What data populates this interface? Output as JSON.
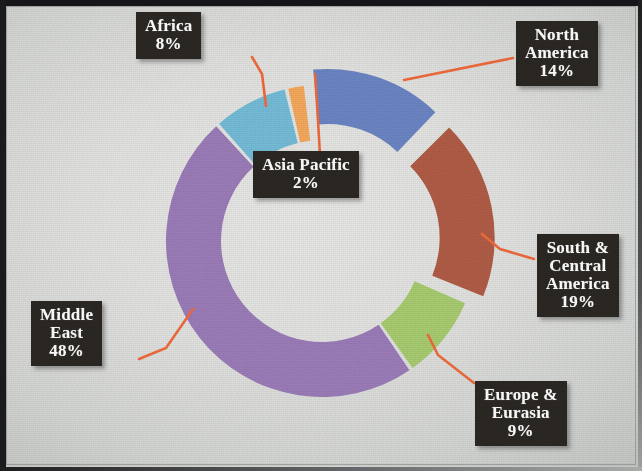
{
  "figure": {
    "background_color": "#e4e5e3",
    "frame_color": "#1a1a1d",
    "label_box_color": "#2b2722",
    "label_text_color": "#ffffff",
    "leader_line_color": "#ef6a3c"
  },
  "chart_data": {
    "type": "pie",
    "variant": "donut",
    "title": "",
    "subtitle": "",
    "xlabel": "",
    "ylabel": "",
    "legend_position": "none",
    "grid": false,
    "units": "percent",
    "total": 100,
    "categories": [
      "North America",
      "South & Central America",
      "Europe & Eurasia",
      "Middle East",
      "Africa",
      "Asia Pacific"
    ],
    "values": [
      14,
      19,
      9,
      48,
      8,
      2
    ],
    "colors": [
      "#6b85c4",
      "#b05c46",
      "#a8cc70",
      "#9b7cb8",
      "#75bcd8",
      "#f5a85c"
    ],
    "exploded": [
      true,
      true,
      false,
      false,
      false,
      false
    ],
    "slices": [
      {
        "name": "North America",
        "value": 14,
        "label": "North\nAmerica",
        "percent_label": "14%",
        "color": "#6b85c4",
        "exploded": true
      },
      {
        "name": "South & Central America",
        "value": 19,
        "label": "South &\nCentral\nAmerica",
        "percent_label": "19%",
        "color": "#b05c46",
        "exploded": true
      },
      {
        "name": "Europe & Eurasia",
        "value": 9,
        "label": "Europe &\nEurasia",
        "percent_label": "9%",
        "color": "#a8cc70",
        "exploded": false
      },
      {
        "name": "Middle East",
        "value": 48,
        "label": "Middle\nEast",
        "percent_label": "48%",
        "color": "#9b7cb8",
        "exploded": false
      },
      {
        "name": "Africa",
        "value": 8,
        "label": "Africa",
        "percent_label": "8%",
        "color": "#75bcd8",
        "exploded": false
      },
      {
        "name": "Asia Pacific",
        "value": 2,
        "label": "Asia Pacific",
        "percent_label": "2%",
        "color": "#f5a85c",
        "exploded": false
      }
    ]
  },
  "labels": {
    "africa": {
      "text": "Africa\n8%"
    },
    "north_america": {
      "text": "North\nAmerica\n14%"
    },
    "asia_pacific": {
      "text": "Asia Pacific\n2%"
    },
    "south_central": {
      "text": "South &\nCentral\nAmerica\n19%"
    },
    "europe": {
      "text": "Europe &\nEurasia\n9%"
    },
    "middle_east": {
      "text": "Middle\nEast\n48%"
    }
  }
}
